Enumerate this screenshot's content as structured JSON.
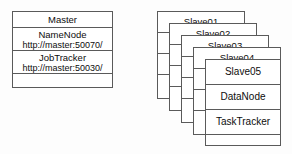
{
  "diagram": {
    "colors": {
      "border": "#5a5a5a",
      "text": "#0d0d0d",
      "background": "#ffffff"
    }
  },
  "master": {
    "header": "Master",
    "services": [
      {
        "name": "NameNode",
        "url": "http://master:50070/"
      },
      {
        "name": "JobTracker",
        "url": "http://master:50030/"
      }
    ]
  },
  "slaves": {
    "cards": [
      {
        "title": "Slave01"
      },
      {
        "title": "Slave02"
      },
      {
        "title": "Slave03"
      },
      {
        "title": "Slave04"
      },
      {
        "title": "Slave05"
      }
    ],
    "front_services": [
      "DataNode",
      "TaskTracker"
    ]
  }
}
